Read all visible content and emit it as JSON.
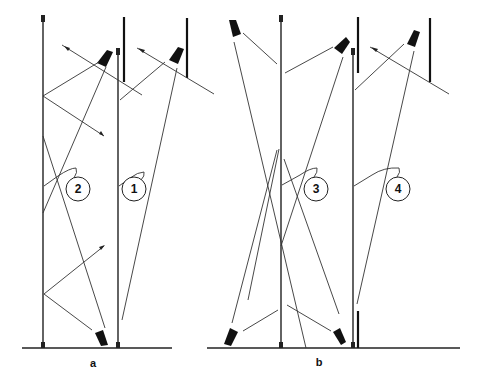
{
  "figure": {
    "panels": [
      {
        "id": "a",
        "label": "a",
        "configurations": [
          "1",
          "2"
        ]
      },
      {
        "id": "b",
        "label": "b",
        "configurations": [
          "3",
          "4"
        ]
      }
    ],
    "callouts": [
      {
        "number": "2",
        "panel": "a"
      },
      {
        "number": "1",
        "panel": "a"
      },
      {
        "number": "3",
        "panel": "b"
      },
      {
        "number": "4",
        "panel": "b"
      }
    ],
    "elements": {
      "lamp-icon": "spotlight",
      "pole": "vertical pole / mirror line",
      "wall": "thick wall segment"
    }
  }
}
